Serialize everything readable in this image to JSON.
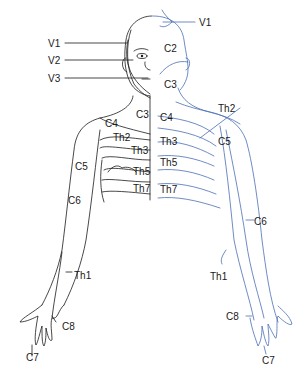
{
  "diagram": {
    "colors": {
      "left_lines": "#1a1a1a",
      "right_lines": "#4a6fb5",
      "labels": "#1a1a1a"
    },
    "labels": {
      "head_left": [
        "V1",
        "V2",
        "V3"
      ],
      "head_right_v1": "V1",
      "head_right_c2": "C2",
      "head_right_c3": "C3",
      "trunk_left": [
        "C3",
        "C4",
        "Th2",
        "Th3",
        "Th5",
        "Th7",
        "C5",
        "C6"
      ],
      "trunk_right": [
        "C4",
        "Th3",
        "Th5",
        "Th7",
        "Th2",
        "C5"
      ],
      "arm_left": [
        "Th1",
        "C8",
        "C7"
      ],
      "arm_right": [
        "C6",
        "Th1",
        "C8",
        "C7"
      ]
    }
  }
}
